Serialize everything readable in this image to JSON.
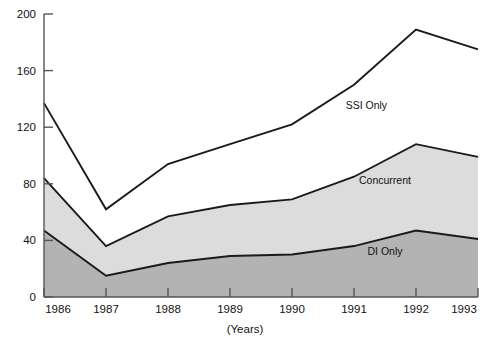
{
  "chart_data": {
    "type": "area",
    "title": "",
    "subtitle": "",
    "xlabel": "(Years)",
    "ylabel": "",
    "stacked": true,
    "grid": false,
    "legend_position": "inline-annotations",
    "categories": [
      "1986",
      "1987",
      "1988",
      "1989",
      "1990",
      "1991",
      "1992",
      "1993"
    ],
    "x": [
      1986,
      1987,
      1988,
      1989,
      1990,
      1991,
      1992,
      1993
    ],
    "xlim": [
      1986,
      1993
    ],
    "ylim": [
      0,
      200
    ],
    "yticks": [
      0,
      40,
      80,
      120,
      160,
      200
    ],
    "xticks": [
      "1986",
      "1987",
      "1988",
      "1989",
      "1990",
      "1991",
      "1992",
      "1993"
    ],
    "series": [
      {
        "name": "DI Only",
        "color": "#b3b3b3",
        "values": [
          47,
          15,
          24,
          29,
          30,
          36,
          47,
          41
        ]
      },
      {
        "name": "Concurrent",
        "color": "#dcdcdc",
        "values": [
          37,
          21,
          33,
          36,
          39,
          49,
          61,
          58
        ]
      },
      {
        "name": "SSI Only",
        "color": "#ffffff",
        "values": [
          53,
          26,
          37,
          43,
          53,
          65,
          81,
          76
        ]
      }
    ],
    "cumulative_totals": {
      "di_only": [
        47,
        15,
        24,
        29,
        30,
        36,
        47,
        41
      ],
      "di_plus_concurrent": [
        84,
        36,
        57,
        65,
        69,
        85,
        108,
        99
      ],
      "grand_total": [
        137,
        62,
        94,
        108,
        122,
        150,
        189,
        175
      ]
    },
    "annotations": [
      {
        "label": "SSI Only",
        "x": 1991.2,
        "y": 133
      },
      {
        "label": "Concurrent",
        "x": 1991.5,
        "y": 80
      },
      {
        "label": "DI Only",
        "x": 1991.5,
        "y": 30
      }
    ]
  },
  "axis": {
    "y_tick_labels": [
      "200",
      "160",
      "120",
      "80",
      "40",
      "0"
    ],
    "x_tick_labels": [
      "1986",
      "1987",
      "1988",
      "1989",
      "1990",
      "1991",
      "1992",
      "1993"
    ],
    "x_axis_title": "(Years)"
  },
  "colors": {
    "di_only_fill": "#b3b3b3",
    "concurrent_fill": "#dcdcdc",
    "ssi_only_fill": "#ffffff",
    "line": "#1a1a1a",
    "axis": "#555555",
    "text": "#111111",
    "background": "#ffffff"
  }
}
